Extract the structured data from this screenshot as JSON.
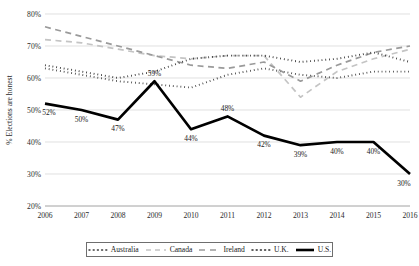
{
  "chart_data": {
    "type": "line",
    "title": "",
    "xlabel": "",
    "ylabel": "% Elections are honest",
    "categories": [
      "2006",
      "2007",
      "2008",
      "2009",
      "2010",
      "2011",
      "2012",
      "2013",
      "2014",
      "2015",
      "2016"
    ],
    "x": [
      2006,
      2007,
      2008,
      2009,
      2010,
      2011,
      2012,
      2013,
      2014,
      2015,
      2016
    ],
    "ylim": [
      20,
      80
    ],
    "ytick_labels": [
      "20%",
      "30%",
      "40%",
      "50%",
      "60%",
      "70%",
      "80%"
    ],
    "ytick_values": [
      20,
      30,
      40,
      50,
      60,
      70,
      80
    ],
    "grid": "horizontal",
    "legend_position": "bottom",
    "series": [
      {
        "name": "Australia",
        "style": "dotted",
        "color": "#3a3a3a",
        "values": [
          63,
          61,
          59,
          58,
          57,
          61,
          63,
          61,
          60,
          62,
          62
        ]
      },
      {
        "name": "Canada",
        "style": "dashed",
        "color": "#c4c4c4",
        "values": [
          72,
          71,
          69,
          67,
          66,
          67,
          67,
          54,
          62,
          66,
          69
        ]
      },
      {
        "name": "Ireland",
        "style": "dashed",
        "color": "#9a9a9a",
        "values": [
          76,
          73,
          70,
          67,
          64,
          63,
          65,
          59,
          64,
          68,
          70
        ]
      },
      {
        "name": "U.K.",
        "style": "dotted",
        "color": "#2a2a2a",
        "values": [
          64,
          62,
          60,
          62,
          66,
          67,
          67,
          65,
          66,
          68,
          65
        ]
      },
      {
        "name": "U.S.",
        "style": "solid",
        "color": "#000000",
        "values": [
          52,
          50,
          47,
          59,
          44,
          48,
          42,
          39,
          40,
          40,
          30
        ],
        "point_labels": [
          "52%",
          "50%",
          "47%",
          "59%",
          "44%",
          "48%",
          "42%",
          "39%",
          "40%",
          "40%",
          "30%"
        ]
      }
    ]
  },
  "legend": {
    "items": [
      {
        "label": "Australia",
        "marker": "dotted-line-swatch"
      },
      {
        "label": "Canada",
        "marker": "dashed-line-swatch"
      },
      {
        "label": "Ireland",
        "marker": "dashed-line-swatch"
      },
      {
        "label": "U.K.",
        "marker": "dotted-line-swatch"
      },
      {
        "label": "U.S.",
        "marker": "solid-line-swatch"
      }
    ]
  }
}
